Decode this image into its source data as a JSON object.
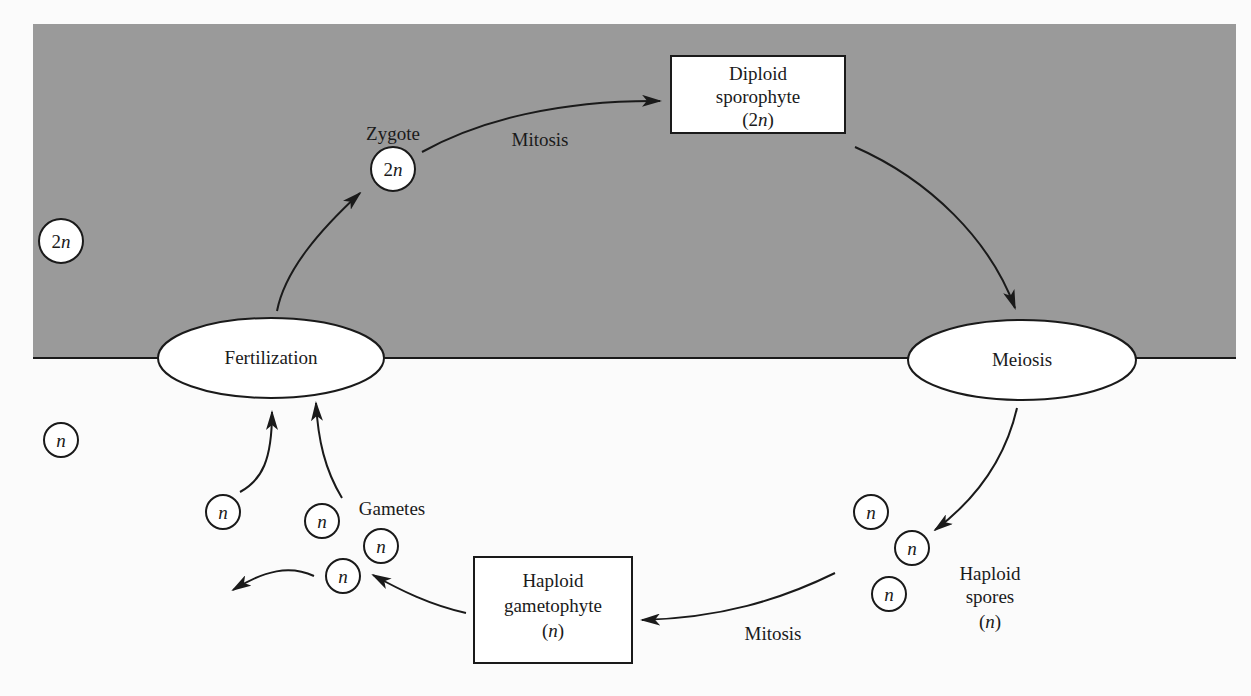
{
  "colors": {
    "diploid_region": "#9a9a9a",
    "haploid_region": "#fbfbfb",
    "stroke": "#1a1a1a",
    "node_fill": "#ffffff"
  },
  "regions": {
    "diploid": {
      "legend_ploidy_num": "2",
      "legend_ploidy_var": "n"
    },
    "haploid": {
      "legend_ploidy_var": "n"
    }
  },
  "nodes": {
    "zygote": {
      "label": "Zygote",
      "ploidy_num": "2",
      "ploidy_var": "n"
    },
    "diploid_sporophyte": {
      "line1": "Diploid",
      "line2": "sporophyte",
      "line3_open": "(2",
      "line3_var": "n",
      "line3_close": ")"
    },
    "fertilization": {
      "label": "Fertilization"
    },
    "meiosis": {
      "label": "Meiosis"
    },
    "haploid_spores": {
      "line1": "Haploid",
      "line2": "spores",
      "line3_open": "(",
      "line3_var": "n",
      "line3_close": ")",
      "cell_var": "n"
    },
    "haploid_gametophyte": {
      "line1": "Haploid",
      "line2": "gametophyte",
      "line3_open": "(",
      "line3_var": "n",
      "line3_close": ")"
    },
    "gametes": {
      "label": "Gametes",
      "cell_var": "n"
    }
  },
  "edges": {
    "mitosis_top": {
      "label": "Mitosis"
    },
    "mitosis_bottom": {
      "label": "Mitosis"
    }
  }
}
